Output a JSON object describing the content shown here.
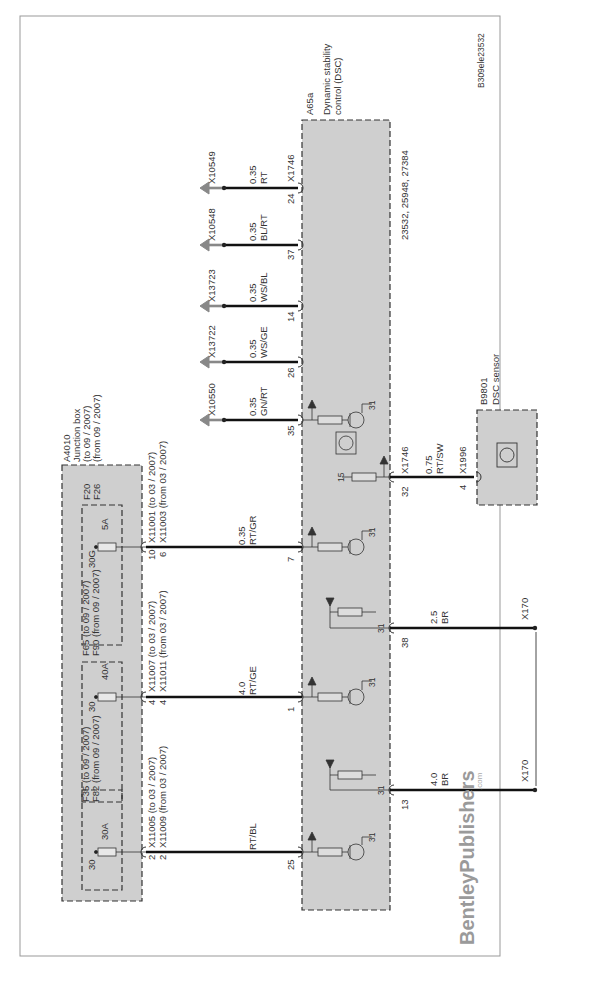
{
  "diagram": {
    "id": "B309ele23532",
    "brand": "BentleyPublishers",
    "brand_suffix": ".com",
    "junction_box": {
      "id": "A4010",
      "name": "Junction box",
      "variant1": "(to 09 / 2007)",
      "variant2": "(from 09 / 2007)",
      "fuses": [
        {
          "terminal": "30",
          "rating": "30A",
          "label1": "F35 (to 09 / 2007)",
          "label2": "F82 (from 09 / 2007)",
          "conn1": "X11005 (to 03 / 2007)",
          "conn2": "X11009 (from 03 / 2007)",
          "pin1": "2",
          "pin2": "2"
        },
        {
          "terminal": "30",
          "rating": "40A",
          "label1": "F65 (to 09 / 2007)",
          "label2": "F90 (from 09 / 2007)",
          "conn1": "X11007 (to 03 / 2007)",
          "conn2": "X11011 (from 03 / 2007)",
          "pin1": "4",
          "pin2": "4"
        },
        {
          "terminal": "30G",
          "rating": "5A",
          "label1": "F20",
          "label2": "F26",
          "conn1": "X11001 (to 03 / 2007)",
          "conn2": "X11003 (from 03 / 2007)",
          "pin1": "10",
          "pin2": "6"
        }
      ]
    },
    "dsc": {
      "id": "A65a",
      "name1": "Dynamic stability",
      "name2": "control (DSC)",
      "refs": "23532, 25948, 27384",
      "connector": "X1746",
      "pins": [
        "25",
        "13",
        "1",
        "38",
        "7",
        "32",
        "35",
        "26",
        "14",
        "37",
        "24"
      ],
      "ground": "31",
      "term15": "15"
    },
    "wires": [
      {
        "pin": "25",
        "gauge": "",
        "color": "RT/BL"
      },
      {
        "pin": "13",
        "gauge": "4.0",
        "color": "BR",
        "to": "X170"
      },
      {
        "pin": "1",
        "gauge": "4.0",
        "color": "RT/GE"
      },
      {
        "pin": "38",
        "gauge": "2.5",
        "color": "BR",
        "to": "X170"
      },
      {
        "pin": "7",
        "gauge": "0.35",
        "color": "RT/GR"
      },
      {
        "pin": "32",
        "gauge": "0.75",
        "color": "RT/SW",
        "to": "X1996",
        "to_pin": "4"
      },
      {
        "pin": "35",
        "gauge": "0.35",
        "color": "GN/RT",
        "to": "X10550"
      },
      {
        "pin": "26",
        "gauge": "0.35",
        "color": "WS/GE",
        "to": "X13722"
      },
      {
        "pin": "14",
        "gauge": "0.35",
        "color": "WS/BL",
        "to": "X13723"
      },
      {
        "pin": "37",
        "gauge": "0.35",
        "color": "BL/RT",
        "to": "X10548"
      },
      {
        "pin": "24",
        "gauge": "0.35",
        "color": "RT",
        "to": "X10549"
      }
    ],
    "sensor": {
      "id": "B9801",
      "name": "DSC sensor"
    }
  }
}
